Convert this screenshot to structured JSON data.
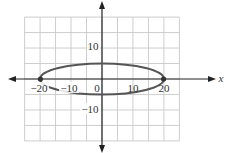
{
  "chart_data": {
    "type": "line",
    "title": "",
    "xlabel": "x",
    "ylabel": "",
    "xlim": [
      -25,
      25
    ],
    "ylim": [
      -20,
      20
    ],
    "grid": true,
    "grid_step": 5,
    "x_tick_labels": [
      "-20",
      "-10",
      "0",
      "10",
      "20"
    ],
    "x_ticks": [
      -20,
      -10,
      0,
      10,
      20
    ],
    "y_tick_labels": [
      "10",
      "-10"
    ],
    "y_ticks": [
      10,
      -10
    ],
    "series": [
      {
        "name": "ellipse",
        "equation": "x^2/400 + y^2/25 = 1",
        "center": [
          0,
          0
        ],
        "semi_major_x": 20,
        "semi_minor_y": 5,
        "x": [
          -20,
          -15,
          -10,
          -5,
          0,
          5,
          10,
          15,
          20
        ],
        "y_upper": [
          0,
          3.31,
          4.33,
          4.84,
          5,
          4.84,
          4.33,
          3.31,
          0
        ],
        "y_lower": [
          0,
          -3.31,
          -4.33,
          -4.84,
          -5,
          -4.84,
          -4.33,
          -3.31,
          0
        ]
      }
    ],
    "points": [
      {
        "x": -20,
        "y": 0
      },
      {
        "x": 20,
        "y": 0
      }
    ],
    "legend": null
  },
  "labels": {
    "x_axis_var": "x",
    "xt_m20": "−20",
    "xt_m10": "−10",
    "xt_0": "0",
    "xt_10": "10",
    "xt_20": "20",
    "yt_10": "10",
    "yt_m10": "−10"
  },
  "colors": {
    "grid": "#c8c8c8",
    "axis": "#222222",
    "curve": "#555555",
    "point": "#333333"
  }
}
